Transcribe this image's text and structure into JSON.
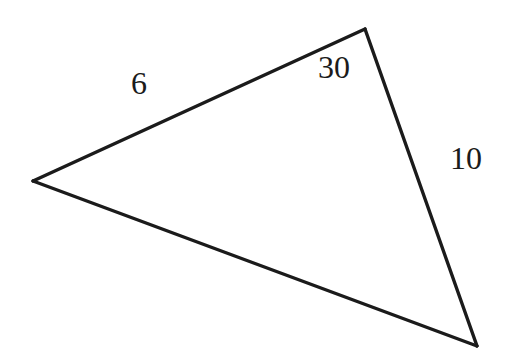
{
  "figure": {
    "kind": "geometry-diagram",
    "shape": "triangle",
    "background_color": "#ffffff",
    "stroke_color": "#1b1b1b",
    "stroke_width": 3.4,
    "canvas": {
      "width": 510,
      "height": 359
    },
    "vertices": [
      {
        "name": "left-vertex",
        "x": 33,
        "y": 181
      },
      {
        "name": "top-right-vertex",
        "x": 365,
        "y": 29
      },
      {
        "name": "bottom-right-vertex",
        "x": 477,
        "y": 346
      }
    ],
    "edges": [
      {
        "name": "upper-left-side",
        "from": "left-vertex",
        "to": "top-right-vertex",
        "label": "6"
      },
      {
        "name": "right-side",
        "from": "top-right-vertex",
        "to": "bottom-right-vertex",
        "label": "10"
      },
      {
        "name": "bottom-side",
        "from": "bottom-right-vertex",
        "to": "left-vertex",
        "label": ""
      }
    ],
    "labels": {
      "side_a": {
        "text": "6",
        "meaning": "length-of-upper-left-side",
        "x": 140,
        "y": 84
      },
      "angle": {
        "text": "30",
        "meaning": "angle-at-top-right-vertex",
        "x": 340,
        "y": 69
      },
      "side_b": {
        "text": "10",
        "meaning": "length-of-right-side",
        "x": 470,
        "y": 160
      }
    }
  }
}
